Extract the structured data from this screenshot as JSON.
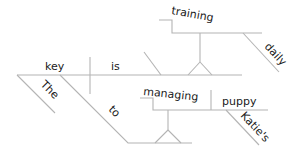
{
  "diagram": {
    "type": "sentence-diagram",
    "sentence": "The key to managing Katie's puppy is training daily",
    "words": {
      "subject": "key",
      "verb": "is",
      "subject_modifier": "The",
      "preposition": "to",
      "gerund_object": "managing",
      "gerund_object_direct_object": "puppy",
      "possessive": "Katie's",
      "predicate_gerund": "training",
      "adverb": "daily"
    },
    "colors": {
      "line": "#b4b4b4",
      "text": "#1a1a1a",
      "background": "#ffffff"
    }
  }
}
